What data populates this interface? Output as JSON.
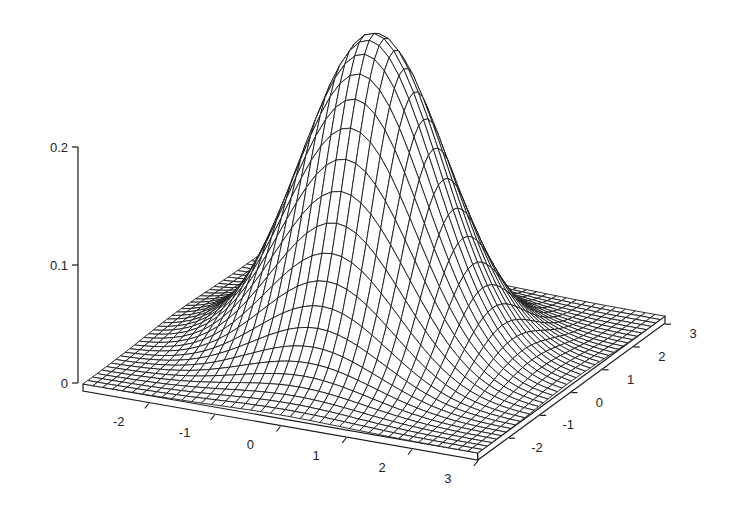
{
  "chart_data": {
    "type": "surface3d",
    "title": "",
    "function": "bivariate standard normal density f(x,y) = exp(-(x^2+y^2)/2) / (2*pi)",
    "x": {
      "label": "",
      "range": [
        -3,
        3
      ],
      "ticks": [
        -2,
        -1,
        0,
        1,
        2,
        3
      ],
      "tick_labels": [
        "-2",
        "-1",
        "0",
        "1",
        "2",
        "3"
      ]
    },
    "y": {
      "label": "",
      "range": [
        -3,
        3
      ],
      "ticks": [
        -2,
        -1,
        0,
        1,
        2,
        3
      ],
      "tick_labels": [
        "-2",
        "-1",
        "0",
        "1",
        "2",
        "3"
      ]
    },
    "z": {
      "label": "",
      "range": [
        0,
        0.2
      ],
      "ticks": [
        0,
        0.1,
        0.2
      ],
      "tick_labels": [
        "0",
        "0.1",
        "0.2"
      ]
    },
    "grid_lines_per_axis": 41,
    "peak": {
      "x": 0,
      "y": 0,
      "z": 0.159
    },
    "style": {
      "wireframe": true,
      "hidden_line_removal": true,
      "line_color": "#1a1a1a",
      "background": "#ffffff",
      "base_slab": true
    }
  },
  "projection": {
    "origin_px": [
      83,
      384
    ],
    "x_unit_px": [
      65.8,
      11.5
    ],
    "y_unit_px": [
      31.2,
      -22.8
    ],
    "surface_z_px_per_unit": 1990,
    "z_axis_px_per_unit": 1180,
    "slab_depth_px": 7
  }
}
